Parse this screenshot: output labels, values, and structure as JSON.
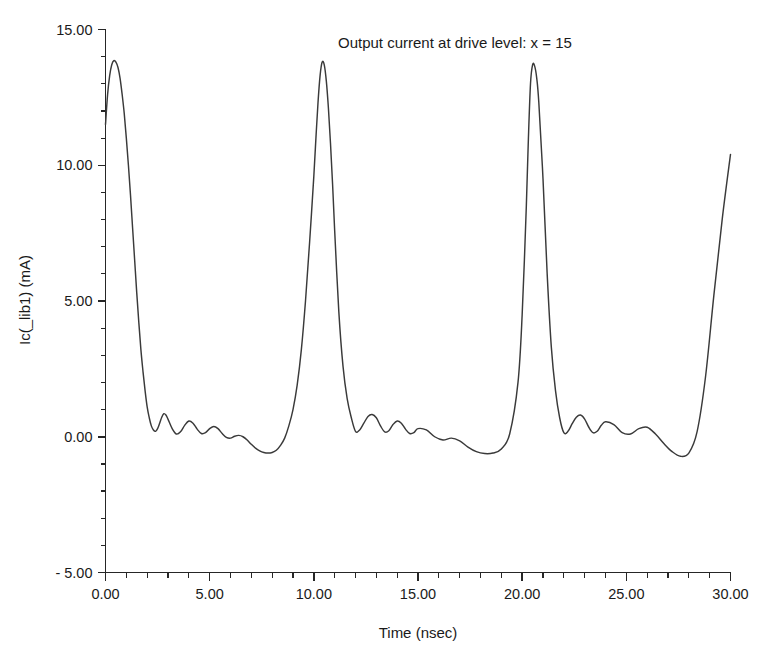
{
  "chart_data": {
    "type": "line",
    "title": "",
    "annotation": "Output current at drive level: x = 15",
    "xlabel": "Time (nsec)",
    "ylabel": "Ic(_lib1) (mA)",
    "xlim": [
      0,
      30
    ],
    "ylim": [
      -5,
      15
    ],
    "grid": false,
    "legend": "none",
    "x_ticks": [
      0,
      5,
      10,
      15,
      20,
      25,
      30
    ],
    "x_tick_labels": [
      "0.00",
      "5.00",
      "10.00",
      "15.00",
      "20.00",
      "25.00",
      "30.00"
    ],
    "x_minor_interval": 1,
    "y_ticks": [
      -5,
      0,
      5,
      10,
      15
    ],
    "y_tick_labels": [
      "- 5.00",
      "0.00",
      "5.00",
      "10.00",
      "15.00"
    ],
    "y_minor_interval": 1,
    "series": [
      {
        "name": "Ic(_lib1)",
        "color": "#3a3a3a",
        "x": [
          0.0,
          0.1,
          0.2,
          0.3,
          0.4,
          0.5,
          0.6,
          0.7,
          0.8,
          0.9,
          1.0,
          1.1,
          1.2,
          1.3,
          1.4,
          1.5,
          1.6,
          1.7,
          1.8,
          1.9,
          2.0,
          2.1,
          2.2,
          2.3,
          2.4,
          2.5,
          2.6,
          2.7,
          2.8,
          2.9,
          3.0,
          3.2,
          3.4,
          3.6,
          3.8,
          4.0,
          4.2,
          4.4,
          4.6,
          4.8,
          5.0,
          5.2,
          5.4,
          5.6,
          5.8,
          6.0,
          6.2,
          6.4,
          6.6,
          6.8,
          7.0,
          7.2,
          7.4,
          7.6,
          7.8,
          8.0,
          8.2,
          8.4,
          8.6,
          8.8,
          9.0,
          9.2,
          9.4,
          9.6,
          9.8,
          10.0,
          10.1,
          10.2,
          10.3,
          10.4,
          10.5,
          10.6,
          10.7,
          10.8,
          10.9,
          11.0,
          11.2,
          11.4,
          11.6,
          11.8,
          12.0,
          12.2,
          12.4,
          12.6,
          12.8,
          13.0,
          13.2,
          13.4,
          13.6,
          13.8,
          14.0,
          14.2,
          14.4,
          14.6,
          14.8,
          15.0,
          15.4,
          15.8,
          16.2,
          16.6,
          17.0,
          17.4,
          17.8,
          18.2,
          18.6,
          19.0,
          19.4,
          19.8,
          20.0,
          20.2,
          20.3,
          20.4,
          20.5,
          20.6,
          20.7,
          20.8,
          21.0,
          21.2,
          21.4,
          21.6,
          21.8,
          22.0,
          22.2,
          22.4,
          22.6,
          22.8,
          23.0,
          23.2,
          23.4,
          23.6,
          23.8,
          24.0,
          24.4,
          24.8,
          25.2,
          25.6,
          26.0,
          26.4,
          26.8,
          27.2,
          27.6,
          28.0,
          28.4,
          28.8,
          29.2,
          29.6,
          30.0
        ],
        "y": [
          11.5,
          12.6,
          13.3,
          13.7,
          13.85,
          13.8,
          13.6,
          13.2,
          12.6,
          11.9,
          11.0,
          10.0,
          8.9,
          7.7,
          6.5,
          5.3,
          4.2,
          3.2,
          2.4,
          1.7,
          1.1,
          0.7,
          0.4,
          0.25,
          0.2,
          0.3,
          0.5,
          0.72,
          0.85,
          0.8,
          0.65,
          0.3,
          0.1,
          0.18,
          0.42,
          0.58,
          0.5,
          0.28,
          0.12,
          0.15,
          0.3,
          0.38,
          0.3,
          0.12,
          -0.02,
          -0.05,
          0.02,
          0.05,
          0.0,
          -0.12,
          -0.28,
          -0.42,
          -0.52,
          -0.58,
          -0.6,
          -0.58,
          -0.5,
          -0.32,
          -0.05,
          0.4,
          1.0,
          1.9,
          3.2,
          5.0,
          7.2,
          9.6,
          11.0,
          12.3,
          13.3,
          13.8,
          13.7,
          13.1,
          12.1,
          10.8,
          9.3,
          7.6,
          4.6,
          2.6,
          1.4,
          0.7,
          0.2,
          0.25,
          0.5,
          0.75,
          0.82,
          0.7,
          0.4,
          0.18,
          0.22,
          0.45,
          0.58,
          0.5,
          0.28,
          0.12,
          0.15,
          0.3,
          0.25,
          0.0,
          -0.12,
          -0.05,
          -0.15,
          -0.38,
          -0.55,
          -0.62,
          -0.6,
          -0.45,
          0.1,
          2.0,
          4.5,
          8.5,
          11.0,
          13.0,
          13.7,
          13.65,
          13.2,
          12.3,
          9.5,
          6.0,
          3.3,
          1.7,
          0.7,
          0.15,
          0.2,
          0.48,
          0.72,
          0.8,
          0.65,
          0.35,
          0.15,
          0.2,
          0.42,
          0.55,
          0.45,
          0.15,
          0.1,
          0.3,
          0.35,
          0.1,
          -0.25,
          -0.55,
          -0.72,
          -0.6,
          0.2,
          2.2,
          5.2,
          8.0,
          10.4
        ]
      }
    ]
  },
  "axes": {
    "x_title": "Time (nsec)",
    "y_title": "Ic(_lib1) (mA)"
  },
  "annotation": {
    "text": "Output current at drive level: x = 15"
  },
  "colors": {
    "series": "#3a3a3a",
    "axis": "#262626",
    "background": "#ffffff",
    "text": "#1a1a1a"
  }
}
